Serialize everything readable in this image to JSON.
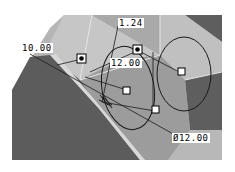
{
  "viewport": {
    "background": "#ffffff",
    "colors": {
      "dark_face": "#5c5c5c",
      "mid_face": "#9a9a9a",
      "light_face": "#c4c4c4",
      "lighter_face": "#b0b0b0",
      "edge_highlight": "#e0e0e0",
      "sketch_line": "#1a1a1a"
    }
  },
  "dimensions": [
    {
      "id": "dim-10",
      "label": "10.00"
    },
    {
      "id": "dim-1-24",
      "label": "1.24"
    },
    {
      "id": "dim-12-radius",
      "label": "12.00"
    },
    {
      "id": "dim-12-diameter",
      "label": "Ø12.00"
    }
  ],
  "handles": {
    "filled": 2,
    "hollow": 3
  }
}
